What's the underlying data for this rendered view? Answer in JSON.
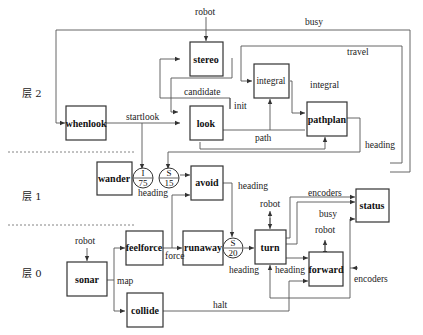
{
  "layers": [
    "层 2",
    "层 1",
    "层 0"
  ],
  "modules": {
    "whenlook": "whenlook",
    "stereo": "stereo",
    "look": "look",
    "integral": "integral",
    "pathplan": "pathplan",
    "wander": "wander",
    "avoid": "avoid",
    "status": "status",
    "sonar": "sonar",
    "feelforce": "feelforce",
    "runaway": "runaway",
    "turn": "turn",
    "forward": "forward",
    "collide": "collide"
  },
  "nodes": {
    "n1": {
      "top": "I",
      "bottom": "75"
    },
    "n2": {
      "top": "S",
      "bottom": "15"
    },
    "n3": {
      "top": "S",
      "bottom": "20"
    }
  },
  "labels": {
    "robot_stereo": "robot",
    "busy_top": "busy",
    "travel": "travel",
    "integral_out": "integral",
    "candidate": "candidate",
    "init": "init",
    "startlook": "startlook",
    "path": "path",
    "heading_pathplan": "heading",
    "heading_wander": "heading",
    "heading_avoid": "heading",
    "encoders_status": "encoders",
    "robot_turn": "robot",
    "busy_forward": "busy",
    "robot_forward": "robot",
    "robot_sonar": "robot",
    "map": "map",
    "force": "force",
    "heading_s20": "heading",
    "heading_turn": "heading",
    "encoders_forward": "encoders",
    "halt": "halt"
  }
}
